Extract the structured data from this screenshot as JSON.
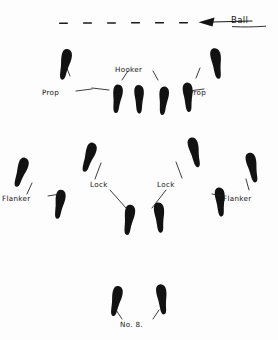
{
  "diagram": {
    "ink_color": "#121212",
    "background_color": "#fdfdfd",
    "ball": {
      "label": "Ball",
      "arrow_direction": "left",
      "dash_count": 7
    },
    "labels": {
      "prop_left": "Prop",
      "prop_right": "Prop",
      "hooker": "Hooker",
      "lock_left": "Lock",
      "lock_right": "Lock",
      "flanker_left": "Flanker",
      "flanker_right": "Flanker",
      "number_eight": "No. 8."
    },
    "rows": [
      {
        "name": "front-row",
        "positions": [
          "Prop",
          "Hooker",
          "Prop"
        ],
        "foot_count": 6
      },
      {
        "name": "second-row",
        "positions": [
          "Lock",
          "Lock"
        ],
        "foot_count": 4
      },
      {
        "name": "flankers",
        "positions": [
          "Flanker",
          "Flanker"
        ],
        "foot_count": 4
      },
      {
        "name": "back-row",
        "positions": [
          "No. 8."
        ],
        "foot_count": 2
      }
    ],
    "total_footprints": 16
  }
}
